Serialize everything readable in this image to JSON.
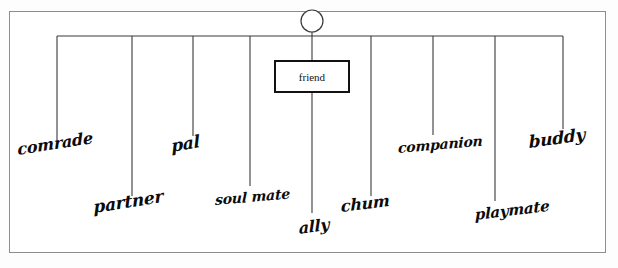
{
  "diagram": {
    "type": "word-association-web",
    "center": {
      "label": "friend",
      "node_shape": "rectangle",
      "marker": "circle"
    },
    "ink_color": "#0b0b0b",
    "border_color": "#8d8d8d",
    "branches": [
      {
        "id": "comrade",
        "label": "comrade",
        "line_x": 57,
        "line_bottom": 142,
        "text_x": 18,
        "text_y": 158,
        "font_size": 16,
        "rotate": -9
      },
      {
        "id": "partner",
        "label": "partner",
        "line_x": 132,
        "line_bottom": 196,
        "text_x": 94,
        "text_y": 216,
        "font_size": 17,
        "rotate": -9
      },
      {
        "id": "pal",
        "label": "pal",
        "line_x": 193,
        "line_bottom": 136,
        "text_x": 172,
        "text_y": 155,
        "font_size": 17,
        "rotate": -10
      },
      {
        "id": "soul-mate",
        "label": "soul mate",
        "line_x": 250,
        "line_bottom": 186,
        "text_x": 215,
        "text_y": 207,
        "font_size": 14,
        "rotate": -5
      },
      {
        "id": "ally",
        "label": "ally",
        "line_x": 312,
        "line_bottom": 213,
        "text_x": 299,
        "text_y": 237,
        "font_size": 16,
        "rotate": -8
      },
      {
        "id": "chum",
        "label": "chum",
        "line_x": 371,
        "line_bottom": 196,
        "text_x": 341,
        "text_y": 215,
        "font_size": 16,
        "rotate": -7
      },
      {
        "id": "companion",
        "label": "companion",
        "line_x": 433,
        "line_bottom": 135,
        "text_x": 398,
        "text_y": 155,
        "font_size": 14,
        "rotate": -5
      },
      {
        "id": "playmate",
        "label": "playmate",
        "line_x": 495,
        "line_bottom": 201,
        "text_x": 475,
        "text_y": 223,
        "font_size": 15,
        "rotate": -7
      },
      {
        "id": "buddy",
        "label": "buddy",
        "line_x": 563,
        "line_bottom": 129,
        "text_x": 529,
        "text_y": 151,
        "font_size": 17,
        "rotate": -8
      }
    ],
    "geometry": {
      "paper": {
        "x": 9,
        "y": 11,
        "w": 597,
        "h": 242
      },
      "spine": {
        "y": 36,
        "x_start": 57,
        "x_end": 563
      },
      "circle": {
        "cx": 312,
        "cy": 21,
        "r": 11
      },
      "box": {
        "x": 274,
        "y": 60,
        "w": 76,
        "h": 33
      },
      "stem_top": {
        "x": 312,
        "y_start": 32,
        "y_end": 60
      },
      "stem_bottom": {
        "x": 312,
        "y_start": 93,
        "y_end": 213
      }
    }
  }
}
